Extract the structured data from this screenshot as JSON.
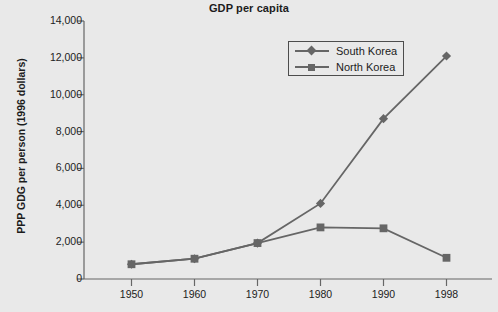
{
  "chart_data": {
    "type": "line",
    "title": "GDP per capita",
    "xlabel": "",
    "ylabel": "PPP GDG per person (1996 dollars)",
    "categories": [
      "1950",
      "1960",
      "1970",
      "1980",
      "1990",
      "1998"
    ],
    "series": [
      {
        "name": "South Korea",
        "marker": "diamond",
        "color": "#666666",
        "values": [
          800,
          1100,
          1950,
          4100,
          8700,
          12100
        ]
      },
      {
        "name": "North Korea",
        "marker": "square",
        "color": "#666666",
        "values": [
          800,
          1100,
          1950,
          2800,
          2750,
          1150
        ]
      }
    ],
    "ylim": [
      0,
      14000
    ],
    "ytick_values": [
      0,
      2000,
      4000,
      6000,
      8000,
      10000,
      12000,
      14000
    ],
    "ytick_labels": [
      "0",
      "2,000",
      "4,000",
      "6,000",
      "8,000",
      "10,000",
      "12,000",
      "14,000"
    ],
    "grid": false,
    "legend_position": "top-right",
    "background_color": "#e9e9e9",
    "axis_color": "#666666"
  },
  "legend": {
    "entries": [
      {
        "label": "South Korea",
        "marker_icon": "diamond-marker-icon"
      },
      {
        "label": "North Korea",
        "marker_icon": "square-marker-icon"
      }
    ]
  }
}
